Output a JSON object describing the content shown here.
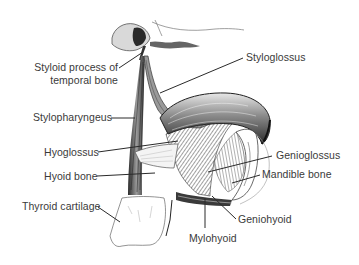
{
  "figure": {
    "style": "monochrome engraving"
  },
  "labels": {
    "styloid_process_line1": "Styloid process of",
    "styloid_process_line2": "temporal bone",
    "styloglossus": "Styloglossus",
    "stylopharyngeus": "Stylopharyngeus",
    "hyoglossus": "Hyoglossus",
    "hyoid_bone": "Hyoid bone",
    "thyroid_cartilage": "Thyroid cartilage",
    "genioglossus": "Genioglossus",
    "mandible_bone": "Mandible bone",
    "geniohyoid": "Geniohyoid",
    "mylohyoid": "Mylohyoid"
  },
  "colors": {
    "background": "#ffffff",
    "text": "#3a3a3a",
    "leader": "#2a2a2a",
    "ink_dark": "#1e1e1e",
    "ink_mid": "#6b6b6b",
    "ink_light": "#b5b5b5"
  }
}
